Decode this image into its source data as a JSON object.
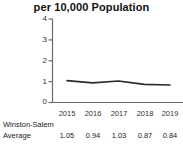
{
  "chart_data": {
    "type": "line",
    "title": "per 10,000 Population",
    "xlabel": "",
    "ylabel": "",
    "x": [
      "2015",
      "2016",
      "2017",
      "2018",
      "2019"
    ],
    "categories": [
      "2015",
      "2016",
      "2017",
      "2018",
      "2019"
    ],
    "series": [
      {
        "name": "Winston-Salem Average",
        "values": [
          1.05,
          0.94,
          1.03,
          0.87,
          0.84
        ]
      }
    ],
    "values": [
      1.05,
      0.94,
      1.03,
      0.87,
      0.84
    ],
    "ylim": [
      0,
      4
    ],
    "yticks": [
      "0",
      "1",
      "2",
      "3",
      "4"
    ],
    "xticks": [
      "2015",
      "2016",
      "2017",
      "2018",
      "2019"
    ],
    "grid": false,
    "legend": false,
    "line_color": "#2b2b2b"
  },
  "axis": {
    "y_labels": [
      "4",
      "3",
      "2",
      "1",
      "0"
    ],
    "x_labels": [
      "2015",
      "2016",
      "2017",
      "2018",
      "2019"
    ]
  },
  "table": {
    "row_label_line1": "Winston-Salem",
    "row_label_line2": "Average",
    "values": [
      "1.05",
      "0.94",
      "1.03",
      "0.87",
      "0.84"
    ]
  }
}
